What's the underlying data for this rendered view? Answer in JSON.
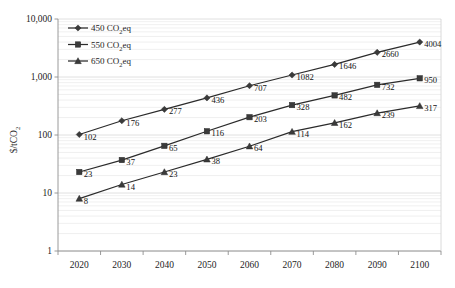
{
  "chart_data": {
    "type": "line",
    "title": "",
    "xlabel": "",
    "ylabel": "$/tCO2",
    "ylabel_main": "$/tCO",
    "ylabel_sub": "2",
    "x": [
      2020,
      2030,
      2040,
      2050,
      2060,
      2070,
      2080,
      2090,
      2100
    ],
    "xtick_labels": [
      "2020",
      "2030",
      "2040",
      "2050",
      "2060",
      "2070",
      "2080",
      "2090",
      "2100"
    ],
    "ytick_labels": [
      "10,000",
      "1,000",
      "100",
      "10",
      "1"
    ],
    "ytick_values": [
      10000,
      1000,
      100,
      10,
      1
    ],
    "ylim": [
      1,
      10000
    ],
    "yscale": "log",
    "grid": "minor-horizontal",
    "legend_position": "top-left",
    "series": [
      {
        "name": "450 CO2eq",
        "label_main": "450 CO",
        "label_sub": "2",
        "label_tail": "eq",
        "marker": "diamond",
        "color": "#2b2b2b",
        "values": [
          102,
          176,
          277,
          436,
          707,
          1082,
          1646,
          2660,
          4004
        ],
        "point_labels": [
          "102",
          "176",
          "277",
          "436",
          "707",
          "1082",
          "1646",
          "2660",
          "4004"
        ]
      },
      {
        "name": "550 CO2eq",
        "label_main": "550 CO",
        "label_sub": "2",
        "label_tail": "eq",
        "marker": "square",
        "color": "#2b2b2b",
        "values": [
          23,
          37,
          65,
          116,
          203,
          328,
          482,
          732,
          950
        ],
        "point_labels": [
          "23",
          "37",
          "65",
          "116",
          "203",
          "328",
          "482",
          "732",
          "950"
        ]
      },
      {
        "name": "650 CO2eq",
        "label_main": "650 CO",
        "label_sub": "2",
        "label_tail": "eq",
        "marker": "triangle",
        "color": "#2b2b2b",
        "values": [
          8,
          14,
          23,
          38,
          64,
          114,
          162,
          239,
          317
        ],
        "point_labels": [
          "8",
          "14",
          "23",
          "38",
          "64",
          "114",
          "162",
          "239",
          "317"
        ]
      }
    ]
  }
}
